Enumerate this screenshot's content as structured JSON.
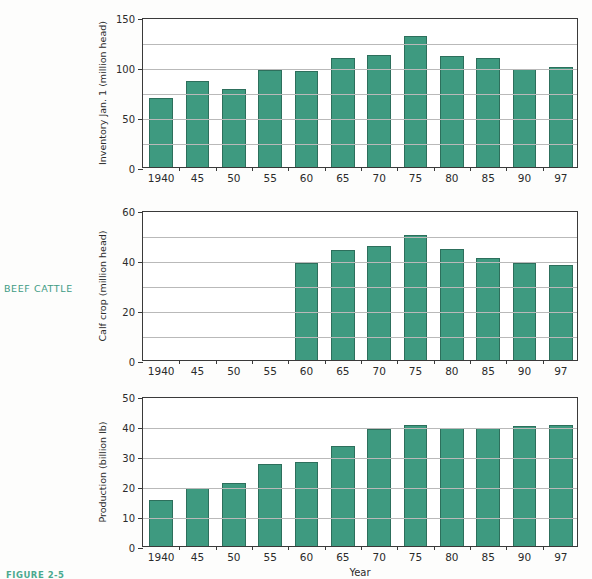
{
  "section_label": "BEEF CATTLE",
  "figure_caption": "FIGURE 2-5",
  "colors": {
    "bar_fill": "#3e9a80",
    "bar_stroke": "#2d6f5c",
    "accent_text": "#3f9b84",
    "axis": "#3a3a3a",
    "grid": "#b9b9b9"
  },
  "chart_data": [
    {
      "type": "bar",
      "title": "",
      "xlabel": "",
      "ylabel": "Inventory Jan. 1 (million head)",
      "categories": [
        "1940",
        "45",
        "50",
        "55",
        "60",
        "65",
        "70",
        "75",
        "80",
        "85",
        "90",
        "97"
      ],
      "values": [
        69,
        86,
        78,
        97,
        96,
        109,
        112,
        131,
        111,
        109,
        98,
        100
      ],
      "ylim": [
        0,
        150
      ],
      "ytick_labels": [
        "0",
        "50",
        "100",
        "150"
      ],
      "ytick_values": [
        0,
        50,
        100,
        150
      ],
      "gridline_values": [
        25,
        50,
        75,
        100,
        125
      ],
      "grid": true,
      "legend": "none"
    },
    {
      "type": "bar",
      "title": "",
      "xlabel": "",
      "ylabel": "Calf crop (million head)",
      "categories": [
        "1940",
        "45",
        "50",
        "55",
        "60",
        "65",
        "70",
        "75",
        "80",
        "85",
        "90",
        "97"
      ],
      "values": [
        null,
        null,
        null,
        null,
        39,
        44,
        45.5,
        50,
        44.5,
        41,
        39,
        38
      ],
      "ylim": [
        0,
        60
      ],
      "ytick_labels": [
        "0",
        "20",
        "40",
        "60"
      ],
      "ytick_values": [
        0,
        20,
        40,
        60
      ],
      "gridline_values": [
        10,
        20,
        30,
        40,
        50
      ],
      "grid": true,
      "legend": "none"
    },
    {
      "type": "bar",
      "title": "",
      "xlabel": "Year",
      "ylabel": "Production (billion lb)",
      "categories": [
        "1940",
        "45",
        "50",
        "55",
        "60",
        "65",
        "70",
        "75",
        "80",
        "85",
        "90",
        "97"
      ],
      "values": [
        15.5,
        19.5,
        21,
        27.5,
        28,
        33.5,
        39,
        40.5,
        39.5,
        39.5,
        40,
        40.5
      ],
      "ylim": [
        0,
        50
      ],
      "ytick_labels": [
        "0",
        "10",
        "20",
        "30",
        "40",
        "50"
      ],
      "ytick_values": [
        0,
        10,
        20,
        30,
        40,
        50
      ],
      "gridline_values": [
        10,
        20,
        30,
        40
      ],
      "grid": true,
      "legend": "none"
    }
  ]
}
